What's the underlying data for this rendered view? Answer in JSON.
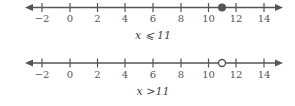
{
  "number_lines": [
    {
      "tick_labels": [
        "−2",
        "0",
        "2",
        "4",
        "6",
        "8",
        "10",
        "12",
        "14"
      ],
      "tick_values": [
        -2,
        0,
        2,
        4,
        6,
        8,
        10,
        12,
        14
      ],
      "point": 11,
      "point_type": "closed",
      "shading": "left",
      "caption": "x ⩽ 11"
    },
    {
      "tick_labels": [
        "−2",
        "0",
        "2",
        "4",
        "6",
        "8",
        "10",
        "12",
        "14"
      ],
      "tick_values": [
        -2,
        0,
        2,
        4,
        6,
        8,
        10,
        12,
        14
      ],
      "point": 11,
      "point_type": "open",
      "shading": "right",
      "caption": "x >11"
    }
  ],
  "colors": {
    "line": "#555555",
    "point": "#555555"
  }
}
